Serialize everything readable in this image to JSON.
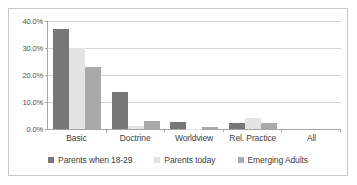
{
  "chart_data": {
    "type": "bar",
    "title": "",
    "subtitle": "",
    "xlabel": "",
    "ylabel": "",
    "categories": [
      "Basic",
      "Doctrine",
      "Worldview",
      "Rel. Practice",
      "All"
    ],
    "series": [
      {
        "name": "Parents when 18-29",
        "color": "#777777",
        "values": [
          37.2,
          13.7,
          2.5,
          2.3,
          0.0
        ]
      },
      {
        "name": "Parents today",
        "color": "#e3e3e3",
        "values": [
          30.0,
          1.1,
          0.1,
          4.2,
          0.0
        ]
      },
      {
        "name": "Emerging Adults",
        "color": "#a9a9a9",
        "values": [
          23.0,
          2.8,
          0.6,
          2.2,
          0.0
        ]
      }
    ],
    "ylim": [
      0,
      40
    ],
    "ytick_values": [
      0,
      10,
      20,
      30,
      40
    ],
    "ytick_labels": [
      "0.0%",
      "10.0%",
      "20.0%",
      "30.0%",
      "40.0%"
    ],
    "grid": true,
    "legend_position": "bottom",
    "value_suffix": "%"
  }
}
